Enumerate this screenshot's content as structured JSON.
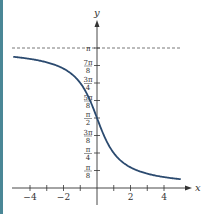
{
  "chart_data": {
    "type": "line",
    "title": "",
    "function": "y = arccot(x)",
    "xlabel": "x",
    "ylabel": "y",
    "xlim": [
      -5,
      5
    ],
    "ylim": [
      0,
      3.14159
    ],
    "x_ticks": [
      -4,
      -3,
      -2,
      -1,
      1,
      2,
      3,
      4
    ],
    "x_tick_labels": [
      "-4",
      "-2",
      "2",
      "4"
    ],
    "y_ticks": [
      "π/8",
      "π/4",
      "3π/8",
      "π/2",
      "5π/8",
      "3π/4",
      "7π/8",
      "π"
    ],
    "asymptote": {
      "y": "π",
      "style": "dashed"
    },
    "series": [
      {
        "name": "arccot(x)",
        "x": [
          -5,
          -4,
          -3,
          -2,
          -1,
          -0.5,
          0,
          0.5,
          1,
          2,
          3,
          4,
          5
        ],
        "values": [
          2.944,
          2.897,
          2.82,
          2.678,
          2.356,
          2.034,
          1.571,
          1.107,
          0.785,
          0.464,
          0.322,
          0.245,
          0.197
        ]
      }
    ],
    "grid": false,
    "legend": null
  },
  "labels": {
    "x_axis": "x",
    "y_axis": "y",
    "x_ticks": [
      {
        "value": -4,
        "text": "−4"
      },
      {
        "value": -2,
        "text": "−2"
      },
      {
        "value": 2,
        "text": "2"
      },
      {
        "value": 4,
        "text": "4"
      }
    ],
    "y_ticks": [
      {
        "num": "π",
        "den": "8"
      },
      {
        "num": "π",
        "den": "4"
      },
      {
        "num": "3π",
        "den": "8"
      },
      {
        "num": "π",
        "den": "2"
      },
      {
        "num": "5π",
        "den": "8"
      },
      {
        "num": "3π",
        "den": "4"
      },
      {
        "num": "7π",
        "den": "8"
      }
    ],
    "pi_label": "π"
  },
  "colors": {
    "curve": "#2b4a6f",
    "axes": "#333333",
    "strip": "#4a8796"
  }
}
